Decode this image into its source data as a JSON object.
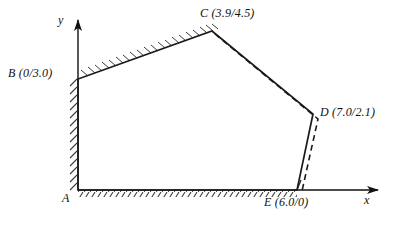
{
  "figure": {
    "axes": {
      "x_label": "x",
      "y_label": "y",
      "x_label_pos": {
        "x": 366,
        "y": 196
      },
      "y_label_pos": {
        "x": 59,
        "y": 16
      },
      "origin": {
        "x": 78,
        "y": 190
      },
      "x_arrow_end": {
        "x": 384,
        "y": 190
      },
      "y_arrow_end": {
        "x": 78,
        "y": 14
      }
    },
    "stroke_color": "#1a1a1a",
    "hatch_color": "#4a4a4a",
    "background": "#ffffff",
    "points": [
      {
        "id": "A",
        "label": "A",
        "coords_text": "",
        "px": {
          "x": 78,
          "y": 190
        },
        "label_pos": {
          "x": 64,
          "y": 196
        }
      },
      {
        "id": "B",
        "label": "B",
        "coords_text": "(0/3.0)",
        "px": {
          "x": 78,
          "y": 79
        },
        "label_pos": {
          "x": 10,
          "y": 68
        }
      },
      {
        "id": "C",
        "label": "C",
        "coords_text": "(3.9/4.5)",
        "px": {
          "x": 212,
          "y": 31
        },
        "label_pos": {
          "x": 202,
          "y": 8
        }
      },
      {
        "id": "D",
        "label": "D",
        "coords_text": "(7.0/2.1)",
        "px": {
          "x": 313,
          "y": 114
        },
        "label_pos": {
          "x": 318,
          "y": 108
        }
      },
      {
        "id": "E",
        "label": "E",
        "coords_text": "(6.0/0)",
        "px": {
          "x": 297,
          "y": 190
        },
        "label_pos": {
          "x": 266,
          "y": 198
        }
      }
    ],
    "labels": [
      {
        "name": "point-label-A",
        "text": "A"
      },
      {
        "name": "point-label-B",
        "text": "B (0/3.0)"
      },
      {
        "name": "point-label-C",
        "text": "C (3.9/4.5)"
      },
      {
        "name": "point-label-D",
        "text": "D (7.0/2.1)"
      },
      {
        "name": "point-label-E",
        "text": "E (6.0/0)"
      }
    ],
    "edges": [
      {
        "from": "A",
        "to": "B",
        "style": "solid-hatched",
        "hatch_side": "left"
      },
      {
        "from": "B",
        "to": "C",
        "style": "solid-hatched",
        "hatch_side": "above"
      },
      {
        "from": "C",
        "to": "D",
        "style": "solid-with-dashed-offset",
        "hatch_side": "none"
      },
      {
        "from": "D",
        "to": "E",
        "style": "solid-with-dashed-offset",
        "hatch_side": "none"
      },
      {
        "from": "E",
        "to": "A",
        "style": "solid-hatched",
        "hatch_side": "below"
      }
    ],
    "dashed_line": {
      "description": "dashed polyline offset from C-D-E",
      "points": [
        {
          "x": 215,
          "y": 34
        },
        {
          "x": 318,
          "y": 119
        },
        {
          "x": 302,
          "y": 191
        }
      ],
      "dash_pattern": "6 4"
    }
  }
}
